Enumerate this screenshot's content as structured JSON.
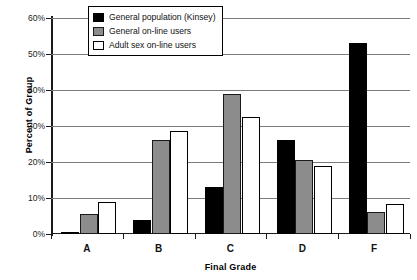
{
  "chart_data": {
    "type": "bar",
    "title": "",
    "xlabel": "Final Grade",
    "ylabel": "Percent of Group",
    "categories": [
      "A",
      "B",
      "C",
      "D",
      "F"
    ],
    "ylim": [
      0,
      60
    ],
    "ytick_labels": [
      "0%",
      "10%",
      "20%",
      "30%",
      "40%",
      "50%",
      "60%"
    ],
    "ytick_values": [
      0,
      10,
      20,
      30,
      40,
      50,
      60
    ],
    "grid": true,
    "legend_position": "top-center",
    "series": [
      {
        "name": "General population (Kinsey)",
        "color": "#000000",
        "values": [
          0.5,
          4.0,
          13.0,
          26.0,
          53.0
        ]
      },
      {
        "name": "General on-line users",
        "color": "#8c8c8c",
        "values": [
          5.6,
          26.0,
          39.0,
          20.5,
          6.0
        ]
      },
      {
        "name": "Adult sex on-line users",
        "color": "#ffffff",
        "values": [
          9.0,
          28.5,
          32.5,
          19.0,
          8.3
        ]
      }
    ]
  },
  "legend": {
    "items": [
      {
        "label": "General population (Kinsey)"
      },
      {
        "label": "General on-line users"
      },
      {
        "label": "Adult sex on-line users"
      }
    ]
  }
}
